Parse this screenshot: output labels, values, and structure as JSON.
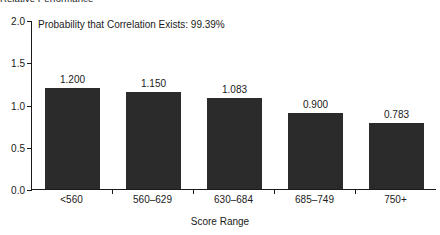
{
  "chart_data": {
    "type": "bar",
    "title": "Relative Performance",
    "xlabel": "Score Range",
    "ylabel": "",
    "categories": [
      "<560",
      "560–629",
      "630–684",
      "685–749",
      "750+"
    ],
    "values": [
      1.2,
      1.15,
      1.083,
      0.9,
      0.783
    ],
    "value_labels": [
      "1.200",
      "1.150",
      "1.083",
      "0.900",
      "0.783"
    ],
    "ylim": [
      0.0,
      2.0
    ],
    "ytick_labels": [
      "0.0",
      "0.5",
      "1.0",
      "1.5",
      "2.0"
    ],
    "ytick_values": [
      0.0,
      0.5,
      1.0,
      1.5,
      2.0
    ],
    "grid": false,
    "legend": "none",
    "annotations": [
      "Probability that Correlation Exists: 99.39%"
    ],
    "bar_color": "#2b2b2b",
    "background_color": "#ffffff",
    "axis_color": "#1a1a1a"
  }
}
